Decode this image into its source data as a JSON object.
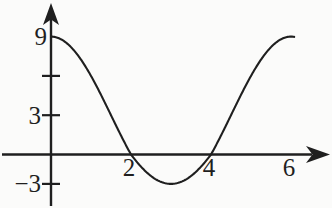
{
  "figure": {
    "background": "#fbfbfa",
    "ink_color": "#1f1f1f"
  },
  "chart_data": {
    "type": "line",
    "title": "",
    "function": {
      "form": "cosine",
      "expression": "y = 3 + 6cos(πx/3)",
      "amplitude": 6,
      "midline": 3,
      "period": 6,
      "phase_shift": 0
    },
    "x_range": [
      0,
      6.08
    ],
    "y_range_shown": [
      -3,
      9
    ],
    "x_ticks": [
      {
        "value": 2,
        "label": "2"
      },
      {
        "value": 4,
        "label": "4"
      },
      {
        "value": 6,
        "label": "6"
      }
    ],
    "y_ticks": [
      {
        "value": 9,
        "label": "9",
        "tick": false
      },
      {
        "value": 6,
        "label": "",
        "tick": true
      },
      {
        "value": 3,
        "label": "3",
        "tick": true
      },
      {
        "value": -3,
        "label": "−3",
        "tick": true
      }
    ],
    "key_points": {
      "y_intercept": [
        0,
        9
      ],
      "x_intercepts": [
        [
          2,
          0
        ],
        [
          4,
          0
        ]
      ],
      "minimum": [
        3,
        -3
      ],
      "maxima": [
        [
          0,
          9
        ],
        [
          6,
          9
        ]
      ]
    },
    "axes": {
      "x_arrow": "right",
      "y_arrow": "up",
      "grid": false,
      "legend": "none"
    }
  }
}
